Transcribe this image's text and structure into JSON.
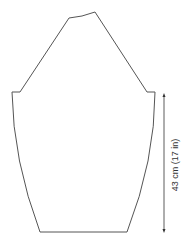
{
  "diagram": {
    "type": "sleeve-schematic",
    "measurements": [
      {
        "label": "43 cm (17 in)",
        "orientation": "vertical",
        "position": "right"
      }
    ],
    "colors": {
      "outline": "#555555",
      "arrow": "#333333",
      "text": "#333333"
    }
  }
}
